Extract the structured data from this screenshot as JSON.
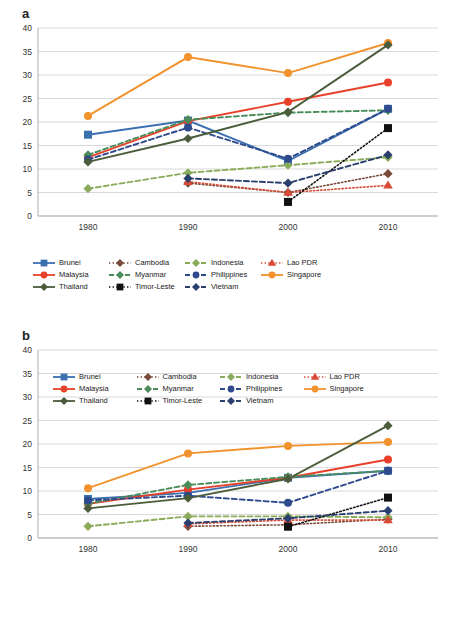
{
  "panels": [
    {
      "label": "a",
      "chart_data": {
        "type": "line",
        "title": "",
        "xlabel": "",
        "ylabel": "",
        "x": [
          "1980",
          "1990",
          "2000",
          "2010"
        ],
        "ylim": [
          0,
          40
        ],
        "yticks": [
          0,
          5,
          10,
          15,
          20,
          25,
          30,
          35,
          40
        ],
        "grid": true,
        "legend_position": "below",
        "series": [
          {
            "name": "Brunei",
            "values": [
              17.3,
              20.3,
              11.7,
              22.8
            ],
            "color": "#3a6fb0",
            "marker": "square",
            "dash": "solid"
          },
          {
            "name": "Cambodia",
            "values": [
              null,
              7.0,
              5.0,
              9.0
            ],
            "color": "#7a4b3a",
            "marker": "diamond",
            "dash": "dotted"
          },
          {
            "name": "Indonesia",
            "values": [
              5.8,
              9.2,
              10.8,
              12.5
            ],
            "color": "#8aab5a",
            "marker": "diamond",
            "dash": "dashed"
          },
          {
            "name": "Lao PDR",
            "values": [
              null,
              7.3,
              5.0,
              6.5
            ],
            "color": "#d94a36",
            "marker": "triangle",
            "dash": "dotted"
          },
          {
            "name": "Malaysia",
            "values": [
              12.5,
              20.2,
              24.3,
              28.4
            ],
            "color": "#e8402a",
            "marker": "circle",
            "dash": "solid"
          },
          {
            "name": "Myanmar",
            "values": [
              13.0,
              20.5,
              22.0,
              22.5
            ],
            "color": "#4a8c5a",
            "marker": "diamond",
            "dash": "dashed"
          },
          {
            "name": "Philippines",
            "values": [
              12.0,
              18.8,
              12.2,
              22.8
            ],
            "color": "#2f4a8c",
            "marker": "circle",
            "dash": "dashed"
          },
          {
            "name": "Singapore",
            "values": [
              21.3,
              33.8,
              30.4,
              36.8
            ],
            "color": "#f2922c",
            "marker": "circle",
            "dash": "solid"
          },
          {
            "name": "Thailand",
            "values": [
              11.5,
              16.5,
              22.1,
              36.4
            ],
            "color": "#4a5c3a",
            "marker": "diamond",
            "dash": "solid"
          },
          {
            "name": "Timor-Leste",
            "values": [
              null,
              null,
              3.0,
              18.7
            ],
            "color": "#111111",
            "marker": "square",
            "dash": "dotted"
          },
          {
            "name": "Vietnam",
            "values": [
              null,
              8.0,
              7.0,
              13.0
            ],
            "color": "#2a3f6e",
            "marker": "diamond",
            "dash": "dashed"
          }
        ]
      }
    },
    {
      "label": "b",
      "chart_data": {
        "type": "line",
        "title": "",
        "xlabel": "",
        "ylabel": "",
        "x": [
          "1980",
          "1990",
          "2000",
          "2010"
        ],
        "ylim": [
          0,
          40
        ],
        "yticks": [
          0,
          5,
          10,
          15,
          20,
          25,
          30,
          35,
          40
        ],
        "grid": true,
        "legend_position": "inside-top",
        "series": [
          {
            "name": "Brunei",
            "values": [
              8.3,
              9.6,
              12.8,
              14.3
            ],
            "color": "#3a6fb0",
            "marker": "square",
            "dash": "solid"
          },
          {
            "name": "Cambodia",
            "values": [
              null,
              2.5,
              2.8,
              4.0
            ],
            "color": "#7a4b3a",
            "marker": "diamond",
            "dash": "dotted"
          },
          {
            "name": "Indonesia",
            "values": [
              2.5,
              4.6,
              4.6,
              4.4
            ],
            "color": "#8aab5a",
            "marker": "diamond",
            "dash": "dashed"
          },
          {
            "name": "Lao PDR",
            "values": [
              null,
              3.0,
              3.8,
              3.8
            ],
            "color": "#d94a36",
            "marker": "triangle",
            "dash": "dotted"
          },
          {
            "name": "Malaysia",
            "values": [
              7.3,
              10.3,
              12.8,
              16.7
            ],
            "color": "#e8402a",
            "marker": "circle",
            "dash": "solid"
          },
          {
            "name": "Myanmar",
            "values": [
              7.3,
              11.3,
              13.0,
              14.3
            ],
            "color": "#4a8c5a",
            "marker": "diamond",
            "dash": "dashed"
          },
          {
            "name": "Philippines",
            "values": [
              8.0,
              9.0,
              7.5,
              14.3
            ],
            "color": "#2f4a8c",
            "marker": "circle",
            "dash": "dashed"
          },
          {
            "name": "Singapore",
            "values": [
              10.6,
              18.0,
              19.6,
              20.4
            ],
            "color": "#f2922c",
            "marker": "circle",
            "dash": "solid"
          },
          {
            "name": "Thailand",
            "values": [
              6.3,
              8.5,
              12.6,
              23.9
            ],
            "color": "#4a5c3a",
            "marker": "diamond",
            "dash": "solid"
          },
          {
            "name": "Timor-Leste",
            "values": [
              null,
              null,
              2.4,
              8.6
            ],
            "color": "#111111",
            "marker": "square",
            "dash": "dotted"
          },
          {
            "name": "Vietnam",
            "values": [
              null,
              3.2,
              4.2,
              5.8
            ],
            "color": "#2a3f6e",
            "marker": "diamond",
            "dash": "dashed"
          }
        ]
      }
    }
  ]
}
